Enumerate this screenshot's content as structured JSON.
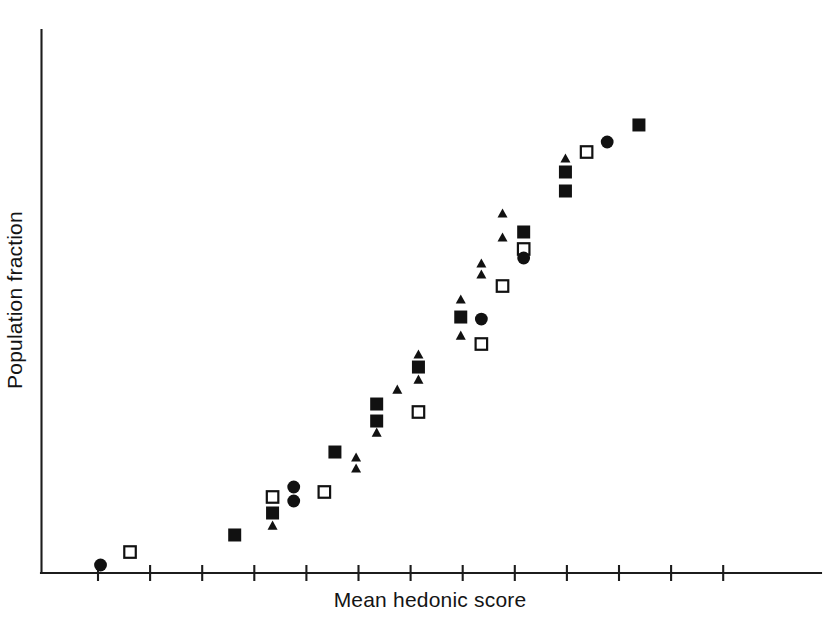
{
  "chart_data": {
    "type": "scatter",
    "title": "",
    "subtitle": "",
    "xlabel": "Mean hedonic score",
    "ylabel": "Population fraction",
    "xlim": [
      0,
      14
    ],
    "ylim": [
      0,
      1
    ],
    "grid": false,
    "legend": false,
    "legend_position": "none",
    "x_tick_labels": [],
    "y_tick_labels": [],
    "x_tick_count": 13,
    "annotations": [],
    "series": [
      {
        "name": "filled-square",
        "marker": "square-filled",
        "points": [
          {
            "x": 3.47,
            "y": 0.07
          },
          {
            "x": 4.15,
            "y": 0.1105
          },
          {
            "x": 5.27,
            "y": 0.2228
          },
          {
            "x": 6.02,
            "y": 0.2799
          },
          {
            "x": 6.02,
            "y": 0.3112
          },
          {
            "x": 6.77,
            "y": 0.3793
          },
          {
            "x": 7.53,
            "y": 0.4714
          },
          {
            "x": 8.66,
            "y": 0.628
          },
          {
            "x": 9.41,
            "y": 0.7035
          },
          {
            "x": 9.41,
            "y": 0.7385
          },
          {
            "x": 10.73,
            "y": 0.8251
          }
        ]
      },
      {
        "name": "open-square",
        "marker": "square-open",
        "points": [
          {
            "x": 1.59,
            "y": 0.0386
          },
          {
            "x": 4.15,
            "y": 0.14
          },
          {
            "x": 5.08,
            "y": 0.1492
          },
          {
            "x": 6.77,
            "y": 0.2965
          },
          {
            "x": 7.9,
            "y": 0.4217
          },
          {
            "x": 8.28,
            "y": 0.5285
          },
          {
            "x": 8.66,
            "y": 0.5967
          },
          {
            "x": 9.79,
            "y": 0.7753
          }
        ]
      },
      {
        "name": "filled-circle",
        "marker": "circle-filled",
        "points": [
          {
            "x": 1.06,
            "y": 0.0147
          },
          {
            "x": 4.53,
            "y": 0.1326
          },
          {
            "x": 4.53,
            "y": 0.1584
          },
          {
            "x": 7.9,
            "y": 0.4677
          },
          {
            "x": 8.66,
            "y": 0.5801
          },
          {
            "x": 10.16,
            "y": 0.7937
          }
        ]
      },
      {
        "name": "filled-triangle",
        "marker": "triangle-filled",
        "points": [
          {
            "x": 4.15,
            "y": 0.0883
          },
          {
            "x": 5.65,
            "y": 0.1934
          },
          {
            "x": 5.65,
            "y": 0.2136
          },
          {
            "x": 6.02,
            "y": 0.2596
          },
          {
            "x": 6.39,
            "y": 0.3388
          },
          {
            "x": 6.77,
            "y": 0.3572
          },
          {
            "x": 6.77,
            "y": 0.4033
          },
          {
            "x": 7.53,
            "y": 0.4382
          },
          {
            "x": 7.53,
            "y": 0.5046
          },
          {
            "x": 7.9,
            "y": 0.5506
          },
          {
            "x": 7.9,
            "y": 0.5709
          },
          {
            "x": 8.28,
            "y": 0.6188
          },
          {
            "x": 8.28,
            "y": 0.663
          },
          {
            "x": 9.41,
            "y": 0.7643
          }
        ]
      }
    ]
  },
  "figure": {
    "background_color": "#ffffff",
    "axis_color": "#1c1c1c",
    "marker_color": "#111111"
  }
}
